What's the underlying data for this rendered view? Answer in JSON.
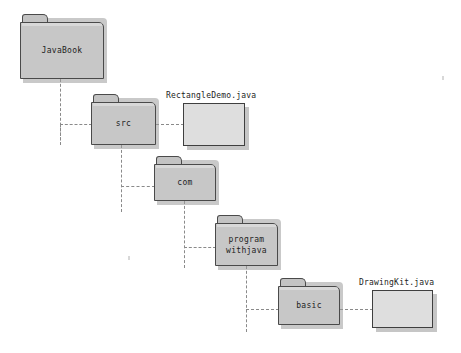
{
  "diagram": {
    "background_color": "#ffffff",
    "folder_fill_color": "#c7c7c7",
    "folder_border_color": "#4a4a4a",
    "file_fill_color": "#dedede",
    "file_border_color": "#3f3f3f",
    "connector_color": "#8a8a8a",
    "connector_style": "dashed"
  },
  "folders": [
    {
      "id": "javabook",
      "label": "JavaBook",
      "x": 20,
      "y": 14,
      "width": 84,
      "height": 65
    },
    {
      "id": "src",
      "label": "src",
      "x": 91,
      "y": 94,
      "width": 65,
      "height": 51
    },
    {
      "id": "com",
      "label": "com",
      "x": 154,
      "y": 156,
      "width": 62,
      "height": 45
    },
    {
      "id": "programwithjava",
      "label": "program\nwithjava",
      "x": 215,
      "y": 215,
      "width": 63,
      "height": 51
    },
    {
      "id": "basic",
      "label": "basic",
      "x": 278,
      "y": 278,
      "width": 62,
      "height": 47
    }
  ],
  "files": [
    {
      "id": "rectangledemo",
      "label": "RectangleDemo.java",
      "label_x": 166,
      "label_y": 91,
      "x": 183,
      "y": 103,
      "width": 62,
      "height": 43
    },
    {
      "id": "drawingkit",
      "label": "DrawingKit.java",
      "label_x": 359,
      "label_y": 278,
      "x": 372,
      "y": 290,
      "width": 61,
      "height": 38
    }
  ],
  "connectors": [
    {
      "id": "javabook-stem",
      "orientation": "vertical",
      "x": 60,
      "y": 79,
      "length": 66
    },
    {
      "id": "javabook-to-src",
      "orientation": "horizontal",
      "x": 60,
      "y": 124,
      "length": 32
    },
    {
      "id": "javabook-stem-tail",
      "orientation": "vertical",
      "x": 60,
      "y": 124,
      "length": 21
    },
    {
      "id": "src-to-file",
      "orientation": "horizontal",
      "x": 156,
      "y": 124,
      "length": 28
    },
    {
      "id": "src-stem",
      "orientation": "vertical",
      "x": 121,
      "y": 145,
      "length": 67
    },
    {
      "id": "src-to-com",
      "orientation": "horizontal",
      "x": 121,
      "y": 186,
      "length": 34
    },
    {
      "id": "com-stem",
      "orientation": "vertical",
      "x": 184,
      "y": 201,
      "length": 67
    },
    {
      "id": "com-to-program",
      "orientation": "horizontal",
      "x": 184,
      "y": 247,
      "length": 32
    },
    {
      "id": "program-stem",
      "orientation": "vertical",
      "x": 246,
      "y": 266,
      "length": 66
    },
    {
      "id": "program-to-basic",
      "orientation": "horizontal",
      "x": 246,
      "y": 309,
      "length": 33
    },
    {
      "id": "basic-to-file",
      "orientation": "horizontal",
      "x": 340,
      "y": 309,
      "length": 33
    }
  ],
  "artifacts": [
    {
      "id": "speck-right",
      "x": 442,
      "y": 76
    },
    {
      "id": "speck-middle",
      "x": 128,
      "y": 256
    }
  ]
}
